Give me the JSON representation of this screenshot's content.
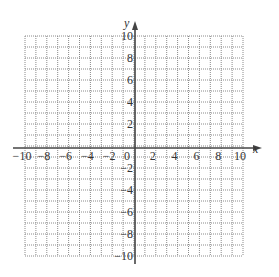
{
  "chart_data": {
    "type": "scatter",
    "title": "",
    "xlabel": "x",
    "ylabel": "y",
    "xlim": [
      -10,
      10
    ],
    "ylim": [
      -10,
      10
    ],
    "grid": true,
    "grid_style": "dotted",
    "grid_step": 1,
    "x_tick_labels": [
      "-10",
      "-8",
      "-6",
      "-4",
      "-2",
      "0",
      "2",
      "4",
      "6",
      "8",
      "10"
    ],
    "y_tick_labels": [
      "10",
      "8",
      "6",
      "4",
      "2",
      "-2",
      "-4",
      "-6",
      "-8",
      "-10"
    ],
    "series": [],
    "legend": null
  },
  "labels": {
    "x_axis": "x",
    "y_axis": "y"
  },
  "colors": {
    "grid": "#8a8a8a",
    "axis": "#444444",
    "text": "#333333"
  }
}
